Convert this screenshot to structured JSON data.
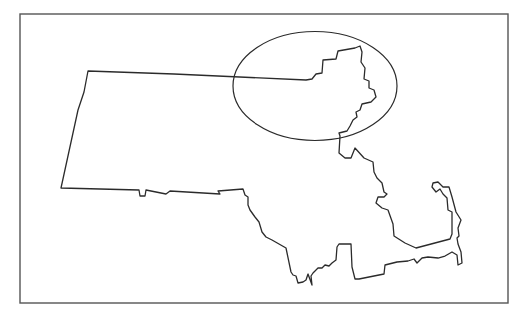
{
  "map": {
    "region": "Massachusetts",
    "background": "#ffffff",
    "stroke_color": "#2b2b2b",
    "frame": {
      "x": 20,
      "y": 14,
      "width": 488,
      "height": 289,
      "stroke": "#555555",
      "stroke_width": 1.4
    },
    "state_outline": {
      "stroke_width": 1.3,
      "points": [
        [
          88,
          71
        ],
        [
          174,
          74
        ],
        [
          306,
          80
        ],
        [
          312,
          79
        ],
        [
          316,
          74
        ],
        [
          322,
          73
        ],
        [
          323,
          60
        ],
        [
          336,
          59
        ],
        [
          338,
          51
        ],
        [
          355,
          48
        ],
        [
          360,
          46
        ],
        [
          362,
          52
        ],
        [
          361,
          62
        ],
        [
          365,
          68
        ],
        [
          364,
          79
        ],
        [
          369,
          81
        ],
        [
          369,
          88
        ],
        [
          374,
          90
        ],
        [
          376,
          97
        ],
        [
          371,
          102
        ],
        [
          362,
          104
        ],
        [
          360,
          110
        ],
        [
          356,
          112
        ],
        [
          357,
          117
        ],
        [
          353,
          120
        ],
        [
          350,
          126
        ],
        [
          347,
          131
        ],
        [
          343,
          132
        ],
        [
          339,
          133
        ],
        [
          340,
          136
        ],
        [
          339,
          153
        ],
        [
          345,
          158
        ],
        [
          351,
          158
        ],
        [
          355,
          148
        ],
        [
          364,
          158
        ],
        [
          373,
          162
        ],
        [
          374,
          172
        ],
        [
          377,
          178
        ],
        [
          382,
          183
        ],
        [
          384,
          192
        ],
        [
          387,
          194
        ],
        [
          384,
          197
        ],
        [
          378,
          197
        ],
        [
          376,
          203
        ],
        [
          382,
          208
        ],
        [
          388,
          210
        ],
        [
          393,
          224
        ],
        [
          394,
          236
        ],
        [
          405,
          243
        ],
        [
          416,
          248
        ],
        [
          450,
          239
        ],
        [
          452,
          234
        ],
        [
          452,
          212
        ],
        [
          448,
          210
        ],
        [
          447,
          198
        ],
        [
          443,
          194
        ],
        [
          440,
          189
        ],
        [
          436,
          192
        ],
        [
          432,
          187
        ],
        [
          433,
          183
        ],
        [
          438,
          182
        ],
        [
          443,
          187
        ],
        [
          449,
          187
        ],
        [
          452,
          197
        ],
        [
          456,
          212
        ],
        [
          461,
          220
        ],
        [
          458,
          228
        ],
        [
          459,
          236
        ],
        [
          457,
          238
        ],
        [
          458,
          244
        ],
        [
          461,
          252
        ],
        [
          462,
          263
        ],
        [
          458,
          265
        ],
        [
          457,
          255
        ],
        [
          452,
          252
        ],
        [
          445,
          256
        ],
        [
          438,
          258
        ],
        [
          428,
          257
        ],
        [
          422,
          258
        ],
        [
          417,
          263
        ],
        [
          414,
          259
        ],
        [
          408,
          261
        ],
        [
          397,
          262
        ],
        [
          385,
          265
        ],
        [
          384,
          274
        ],
        [
          359,
          279
        ],
        [
          355,
          279
        ],
        [
          352,
          267
        ],
        [
          351,
          244
        ],
        [
          343,
          244
        ],
        [
          339,
          244
        ],
        [
          337,
          247
        ],
        [
          336,
          260
        ],
        [
          332,
          263
        ],
        [
          329,
          266
        ],
        [
          325,
          265
        ],
        [
          322,
          268
        ],
        [
          318,
          268
        ],
        [
          313,
          273
        ],
        [
          311,
          276
        ],
        [
          312,
          285
        ],
        [
          308,
          274
        ],
        [
          306,
          280
        ],
        [
          303,
          282
        ],
        [
          298,
          283
        ],
        [
          296,
          276
        ],
        [
          293,
          275
        ],
        [
          291,
          272
        ],
        [
          286,
          248
        ],
        [
          279,
          244
        ],
        [
          272,
          240
        ],
        [
          266,
          237
        ],
        [
          262,
          232
        ],
        [
          259,
          222
        ],
        [
          255,
          217
        ],
        [
          250,
          210
        ],
        [
          248,
          205
        ],
        [
          248,
          197
        ],
        [
          245,
          195
        ],
        [
          243,
          189
        ],
        [
          218,
          189
        ],
        [
          166,
          194
        ],
        [
          170,
          191
        ],
        [
          218,
          191
        ],
        [
          220,
          194
        ],
        [
          251,
          192
        ],
        [
          254,
          196
        ],
        [
          297,
          196
        ],
        [
          166,
          194
        ]
      ]
    },
    "highlight_ellipse": {
      "label": "northeast-region-highlight",
      "cx": 315,
      "cy": 86,
      "rx": 82,
      "ry": 54.5,
      "stroke": "#2b2b2b",
      "stroke_width": 1.2
    }
  },
  "chart_data": {
    "type": "map",
    "title": "",
    "region": "Massachusetts, USA",
    "annotations": [
      {
        "type": "ellipse",
        "description": "Highlight around northeastern Massachusetts (Essex County / North Shore area)",
        "cx": 315,
        "cy": 86,
        "rx": 82,
        "ry": 54.5
      }
    ],
    "text_labels": []
  }
}
